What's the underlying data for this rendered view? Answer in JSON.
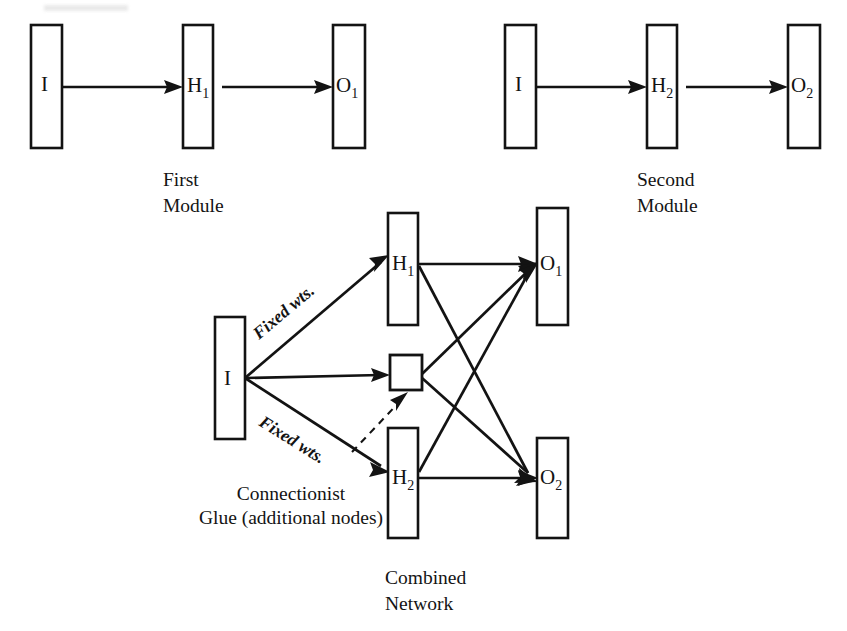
{
  "figure": {
    "background_color": "#ffffff",
    "ink_color": "#131313"
  },
  "modules": [
    {
      "id": "first-module",
      "caption_line1": "First",
      "caption_line2": "Module",
      "nodes": [
        {
          "id": "m1-input",
          "label": "I",
          "subscript": ""
        },
        {
          "id": "m1-hidden",
          "label": "H",
          "subscript": "1"
        },
        {
          "id": "m1-output",
          "label": "O",
          "subscript": "1"
        }
      ],
      "edges": [
        {
          "from": "m1-input",
          "to": "m1-hidden"
        },
        {
          "from": "m1-hidden",
          "to": "m1-output"
        }
      ]
    },
    {
      "id": "second-module",
      "caption_line1": "Second",
      "caption_line2": "Module",
      "nodes": [
        {
          "id": "m2-input",
          "label": "I",
          "subscript": ""
        },
        {
          "id": "m2-hidden",
          "label": "H",
          "subscript": "2"
        },
        {
          "id": "m2-output",
          "label": "O",
          "subscript": "2"
        }
      ],
      "edges": [
        {
          "from": "m2-input",
          "to": "m2-hidden"
        },
        {
          "from": "m2-hidden",
          "to": "m2-output"
        }
      ]
    }
  ],
  "combined": {
    "id": "combined-network",
    "caption_line1": "Combined",
    "caption_line2": "Network",
    "nodes": [
      {
        "id": "c-input",
        "label": "I",
        "subscript": ""
      },
      {
        "id": "c-hidden-1",
        "label": "H",
        "subscript": "1"
      },
      {
        "id": "c-glue",
        "label": "",
        "subscript": ""
      },
      {
        "id": "c-hidden-2",
        "label": "H",
        "subscript": "2"
      },
      {
        "id": "c-output-1",
        "label": "O",
        "subscript": "1"
      },
      {
        "id": "c-output-2",
        "label": "O",
        "subscript": "2"
      }
    ],
    "edge_tags": [
      {
        "id": "fixed-wts-upper",
        "text": "Fixed wts."
      },
      {
        "id": "fixed-wts-lower",
        "text": "Fixed wts."
      }
    ],
    "annotation": {
      "id": "connectionist-glue-note",
      "line1": "Connectionist",
      "line2": "Glue (additional nodes)"
    },
    "edges": [
      {
        "from": "c-input",
        "to": "c-hidden-1",
        "style": "solid",
        "tag": "Fixed wts."
      },
      {
        "from": "c-input",
        "to": "c-glue",
        "style": "solid",
        "tag": ""
      },
      {
        "from": "c-input",
        "to": "c-hidden-2",
        "style": "solid",
        "tag": "Fixed wts."
      },
      {
        "from": "c-hidden-1",
        "to": "c-output-1",
        "style": "solid",
        "tag": ""
      },
      {
        "from": "c-hidden-1",
        "to": "c-output-2",
        "style": "solid",
        "tag": ""
      },
      {
        "from": "c-glue",
        "to": "c-output-1",
        "style": "solid",
        "tag": ""
      },
      {
        "from": "c-glue",
        "to": "c-output-2",
        "style": "solid",
        "tag": ""
      },
      {
        "from": "c-hidden-2",
        "to": "c-output-1",
        "style": "solid",
        "tag": ""
      },
      {
        "from": "c-hidden-2",
        "to": "c-output-2",
        "style": "solid",
        "tag": ""
      }
    ]
  }
}
